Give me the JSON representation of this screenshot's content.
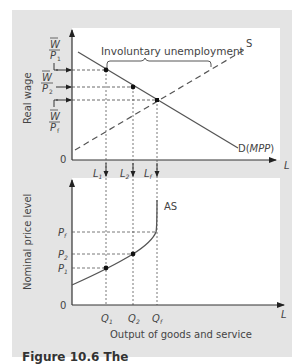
{
  "figure": {
    "caption_partial": "Figure 10.6 The",
    "colors": {
      "background": "#e4e4e4",
      "plot_area": "#ffffff",
      "line": "#555555",
      "point": "#111111"
    }
  },
  "top_panel": {
    "y_axis_label": "Real wage",
    "x_axis_label": "L",
    "origin_label": "0",
    "y_ticks": [
      {
        "num": "W",
        "den": "P",
        "sub": "1"
      },
      {
        "num": "W",
        "den": "P",
        "sub": "2"
      },
      {
        "num": "W",
        "den": "P",
        "sub": "f"
      }
    ],
    "x_ticks": [
      {
        "main": "L",
        "sub": "1"
      },
      {
        "main": "L",
        "sub": "2"
      },
      {
        "main": "L",
        "sub": "f"
      }
    ],
    "annotation": "Involuntary unemployment",
    "curves": {
      "supply_label": "S",
      "demand_label_prefix": "D(",
      "demand_label_italic": "MPP",
      "demand_label_suffix": ")"
    }
  },
  "bottom_panel": {
    "y_axis_label": "Nominal price level",
    "x_axis_label": "L",
    "origin_label": "0",
    "x_title": "Output of goods and service",
    "y_ticks": [
      {
        "main": "P",
        "sub": "f"
      },
      {
        "main": "P",
        "sub": "2"
      },
      {
        "main": "P",
        "sub": "1"
      }
    ],
    "x_ticks": [
      {
        "main": "Q",
        "sub": "1"
      },
      {
        "main": "Q",
        "sub": "2"
      },
      {
        "main": "Q",
        "sub": "f"
      }
    ],
    "curve_label": "AS"
  }
}
